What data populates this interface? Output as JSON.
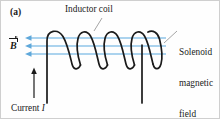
{
  "figure": {
    "panel_label": "(a)",
    "caption_subject": "inductor-coil-solenoid-magnetic-field",
    "background_color": "#ffffff",
    "border_color": "#cfcfcf"
  },
  "labels": {
    "panel": "(a)",
    "inductor_coil": "Inductor coil",
    "solenoid_field_line1": "Solenoid",
    "solenoid_field_line2": "magnetic",
    "solenoid_field_line3": "field",
    "current": "Current ",
    "current_symbol": "I",
    "b_field_symbol": "B"
  },
  "colors": {
    "wire": "#1a1a1a",
    "field_line": "#8fc4e8",
    "field_arrow": "#5fa8da",
    "text": "#1a1a1a",
    "leader_line": "#9a9a9a"
  },
  "geometry": {
    "coil_turns": 5,
    "field_line_count": 3,
    "field_line_direction": "left",
    "current_direction": "up",
    "field_line_y_positions": [
      37,
      45,
      53
    ],
    "field_line_x_start": 165,
    "field_line_x_end": 24,
    "lead_left_x": 46,
    "lead_right_x": 141,
    "lead_bottom_y": 102,
    "coil_top_y": 29,
    "coil_bottom_y": 68
  }
}
